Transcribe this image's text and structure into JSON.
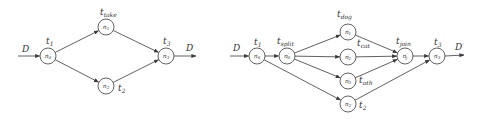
{
  "diagrams": [
    {
      "id": "left",
      "input": {
        "label": "D",
        "label_pos": [
          22,
          52
        ],
        "from": [
          18,
          56
        ],
        "to_node": "n0"
      },
      "output": {
        "label": "D",
        "prime": "′",
        "label_pos": [
          186,
          51
        ],
        "from_node": "n3",
        "to": [
          196,
          56
        ]
      },
      "nodes": [
        {
          "id": "n0",
          "main": "n",
          "sub": "0",
          "sup": "",
          "x": 48,
          "y": 56,
          "t_main": "t",
          "t_sub": "1",
          "tx": 46,
          "ty": 44
        },
        {
          "id": "n1",
          "main": "n",
          "sub": "1",
          "sup": "",
          "x": 106,
          "y": 27,
          "t_main": "t",
          "t_sub": "take",
          "tx": 100,
          "ty": 15
        },
        {
          "id": "n2",
          "main": "n",
          "sub": "2",
          "sup": "",
          "x": 106,
          "y": 86,
          "t_main": "t",
          "t_sub": "2",
          "tx": 118,
          "ty": 91
        },
        {
          "id": "n3",
          "main": "n",
          "sub": "3",
          "sup": "",
          "x": 166,
          "y": 56,
          "t_main": "t",
          "t_sub": "3",
          "tx": 163,
          "ty": 44
        }
      ],
      "edges": [
        [
          "n0",
          "n1"
        ],
        [
          "n0",
          "n2"
        ],
        [
          "n1",
          "n3"
        ],
        [
          "n2",
          "n3"
        ]
      ]
    },
    {
      "id": "right",
      "input": {
        "label": "D",
        "label_pos": [
          233,
          51
        ],
        "from": [
          230,
          56
        ],
        "to_node": "r_n0"
      },
      "output": {
        "label": "D",
        "prime": "′",
        "label_pos": [
          455,
          50
        ],
        "from_node": "r_n3",
        "to": [
          464,
          55
        ]
      },
      "nodes": [
        {
          "id": "r_n0",
          "main": "n",
          "sub": "0",
          "sup": "",
          "x": 257,
          "y": 56,
          "t_main": "t",
          "t_sub": "1",
          "tx": 254,
          "ty": 45
        },
        {
          "id": "r_n0p",
          "main": "n",
          "sub": "0",
          "sup": "′",
          "x": 287,
          "y": 56,
          "t_main": "t",
          "t_sub": "split",
          "tx": 277,
          "ty": 44
        },
        {
          "id": "r_n1p",
          "main": "n",
          "sub": "1",
          "sup": "′",
          "x": 348,
          "y": 32,
          "t_main": "t",
          "t_sub": "dog",
          "tx": 337,
          "ty": 17
        },
        {
          "id": "r_n2p",
          "main": "n",
          "sub": "2",
          "sup": "′",
          "x": 348,
          "y": 57,
          "t_main": "t",
          "t_sub": "cat",
          "tx": 357,
          "ty": 46
        },
        {
          "id": "r_n3p",
          "main": "n",
          "sub": "3",
          "sup": "′",
          "x": 348,
          "y": 81,
          "t_main": "t",
          "t_sub": "oth",
          "tx": 359,
          "ty": 83
        },
        {
          "id": "r_n2",
          "main": "n",
          "sub": "2",
          "sup": "",
          "x": 348,
          "y": 104,
          "t_main": "t",
          "t_sub": "2",
          "tx": 359,
          "ty": 108
        },
        {
          "id": "r_njp",
          "main": "n",
          "sub": "j",
          "sup": "′",
          "x": 405,
          "y": 56,
          "t_main": "t",
          "t_sub": "join",
          "tx": 396,
          "ty": 44
        },
        {
          "id": "r_n3",
          "main": "n",
          "sub": "3",
          "sup": "",
          "x": 437,
          "y": 56,
          "t_main": "t",
          "t_sub": "3",
          "tx": 434,
          "ty": 45
        }
      ],
      "edges": [
        [
          "r_n0",
          "r_n0p"
        ],
        [
          "r_n0",
          "r_n2"
        ],
        [
          "r_n0p",
          "r_n1p"
        ],
        [
          "r_n0p",
          "r_n2p"
        ],
        [
          "r_n0p",
          "r_n3p"
        ],
        [
          "r_n1p",
          "r_njp"
        ],
        [
          "r_n2p",
          "r_njp"
        ],
        [
          "r_n3p",
          "r_njp"
        ],
        [
          "r_njp",
          "r_n3"
        ],
        [
          "r_n2",
          "r_n3"
        ]
      ]
    }
  ],
  "style": {
    "stroke": "#3a3a3a",
    "text": "#333333",
    "background": "#ffffff",
    "node_radius": 8
  }
}
